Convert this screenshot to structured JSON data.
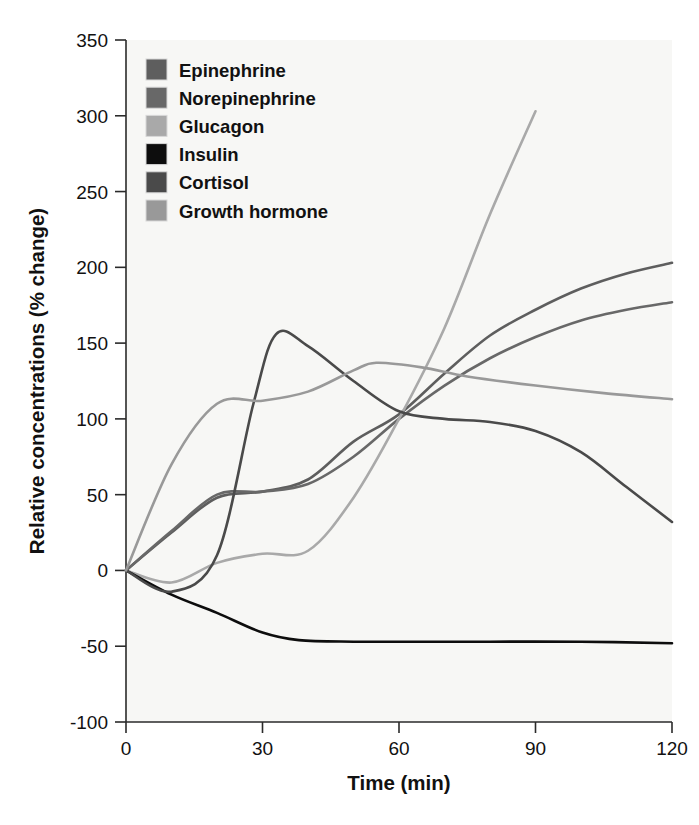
{
  "chart_data": {
    "type": "line",
    "title": "",
    "xlabel": "Time (min)",
    "ylabel": "Relative concentrations (% change)",
    "xlim": [
      0,
      120
    ],
    "ylim": [
      -100,
      350
    ],
    "xticks": [
      0,
      30,
      60,
      90,
      120
    ],
    "yticks": [
      -100,
      -50,
      0,
      50,
      100,
      150,
      200,
      250,
      300,
      350
    ],
    "xtick_labels": [
      "0",
      "30",
      "60",
      "90",
      "120"
    ],
    "ytick_labels": [
      "-100",
      "-50",
      "0",
      "50",
      "100",
      "150",
      "200",
      "250",
      "300",
      "350"
    ],
    "grid": false,
    "legend_position": "top-left",
    "background": "#f7f7f5",
    "series": [
      {
        "name": "Epinephrine",
        "color": "#5e5e5e",
        "x": [
          0,
          10,
          20,
          30,
          40,
          50,
          60,
          70,
          80,
          90,
          100,
          110,
          120
        ],
        "y": [
          0,
          25,
          48,
          52,
          60,
          85,
          103,
          130,
          155,
          172,
          186,
          196,
          203
        ]
      },
      {
        "name": "Norepinephrine",
        "color": "#686868",
        "x": [
          0,
          10,
          20,
          30,
          40,
          50,
          60,
          70,
          80,
          90,
          100,
          110,
          120
        ],
        "y": [
          0,
          26,
          50,
          52,
          57,
          75,
          100,
          122,
          140,
          154,
          165,
          172,
          177
        ]
      },
      {
        "name": "Glucagon",
        "color": "#a9a9a9",
        "x": [
          0,
          10,
          20,
          30,
          40,
          50,
          60,
          70,
          80,
          90
        ],
        "y": [
          0,
          -8,
          5,
          11,
          13,
          48,
          100,
          160,
          235,
          303
        ]
      },
      {
        "name": "Insulin",
        "color": "#0d0d0d",
        "x": [
          0,
          10,
          20,
          30,
          38,
          50,
          60,
          80,
          100,
          120
        ],
        "y": [
          0,
          -16,
          -28,
          -41,
          -46,
          -47,
          -47,
          -47,
          -47,
          -48
        ]
      },
      {
        "name": "Cortisol",
        "color": "#4a4a4a",
        "x": [
          0,
          10,
          20,
          28,
          33,
          40,
          50,
          60,
          70,
          80,
          90,
          100,
          110,
          120
        ],
        "y": [
          0,
          -14,
          10,
          110,
          156,
          148,
          125,
          105,
          100,
          98,
          92,
          78,
          55,
          32
        ]
      },
      {
        "name": "Growth hormone",
        "color": "#999999",
        "x": [
          0,
          10,
          20,
          30,
          40,
          50,
          55,
          65,
          75,
          90,
          105,
          120
        ],
        "y": [
          0,
          70,
          110,
          112,
          118,
          132,
          137,
          134,
          128,
          122,
          117,
          113
        ]
      }
    ]
  },
  "legend": {
    "items": [
      {
        "label": "Epinephrine",
        "swatch": "#5e5e5e"
      },
      {
        "label": "Norepinephrine",
        "swatch": "#686868"
      },
      {
        "label": "Glucagon",
        "swatch": "#a9a9a9"
      },
      {
        "label": "Insulin",
        "swatch": "#0d0d0d"
      },
      {
        "label": "Cortisol",
        "swatch": "#4a4a4a"
      },
      {
        "label": "Growth hormone",
        "swatch": "#999999"
      }
    ]
  },
  "axes": {
    "x_label": "Time (min)",
    "y_label": "Relative concentrations (% change)",
    "x_ticks": [
      "0",
      "30",
      "60",
      "90",
      "120"
    ],
    "y_ticks": [
      "350",
      "300",
      "250",
      "200",
      "150",
      "100",
      "50",
      "0",
      "-50",
      "-100"
    ]
  }
}
